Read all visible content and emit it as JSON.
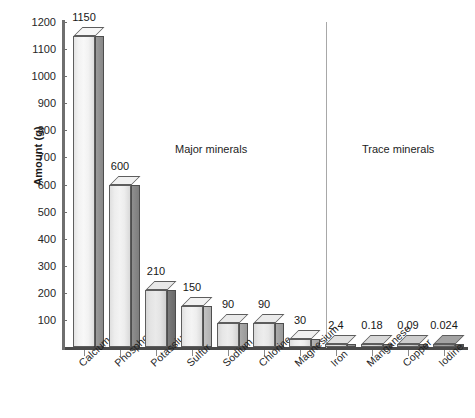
{
  "chart_data": {
    "type": "bar",
    "title": "",
    "xlabel": "",
    "ylabel": "Amount (g)",
    "ylim": [
      0,
      1200
    ],
    "ytick_step": 100,
    "grid": false,
    "legend": null,
    "categories": [
      "Calcium",
      "Phosphorus",
      "Potassium",
      "Sulfur",
      "Sodium",
      "Chlorine",
      "Magnesium",
      "Iron",
      "Manganese",
      "Copper",
      "Iodine"
    ],
    "values": [
      1150,
      600,
      210,
      150,
      90,
      90,
      30,
      2.4,
      0.18,
      0.09,
      0.024
    ],
    "value_labels": [
      "1150",
      "600",
      "210",
      "150",
      "90",
      "90",
      "30",
      "2.4",
      "0.18",
      "0.09",
      "0.024"
    ],
    "ytick_labels": [
      "1200",
      "1100",
      "1000",
      "900",
      "800",
      "700",
      "600",
      "500",
      "400",
      "300",
      "200",
      "100"
    ],
    "ytick_values": [
      1200,
      1100,
      1000,
      900,
      800,
      700,
      600,
      500,
      400,
      300,
      200,
      100
    ],
    "annotations": [
      {
        "text": "Major minerals",
        "group": "major"
      },
      {
        "text": "Trace minerals",
        "group": "trace"
      }
    ],
    "groups": [
      {
        "name": "Major minerals",
        "categories": [
          "Calcium",
          "Phosphorus",
          "Potassium",
          "Sulfur",
          "Sodium",
          "Chlorine",
          "Magnesium"
        ]
      },
      {
        "name": "Trace minerals",
        "categories": [
          "Iron",
          "Manganese",
          "Copper",
          "Iodine"
        ]
      }
    ],
    "style": {
      "bar_style": "3d-box",
      "background": "#ffffff",
      "axis_color": "#4a4a4a",
      "text_color": "#1a1a1a",
      "bar_face_colors": [
        "#f2f2f2",
        "#ededed",
        "#e4e4e4",
        "#eeeeee",
        "#e6e6e6",
        "#e7e7e7",
        "#ececec",
        "#dcdcdc",
        "#d4d4d4",
        "#c9c9c9",
        "#9f9f9f"
      ],
      "bar_side_colors": [
        "#9a9a9a",
        "#8f8f8f",
        "#7c7c7c",
        "#c3c3c3",
        "#aaaaaa",
        "#ababab",
        "#b4b4b4",
        "#9b9b9b",
        "#8e8e8e",
        "#848484",
        "#6a6a6a"
      ]
    }
  },
  "axis": {
    "y_title": "Amount (g)"
  },
  "captions": {
    "major": "Major minerals",
    "trace": "Trace minerals"
  }
}
